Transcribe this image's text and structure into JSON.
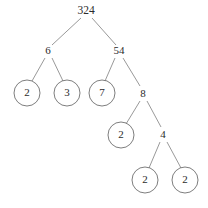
{
  "figure": {
    "width": 208,
    "height": 208,
    "background": "#ffffff",
    "line_color": "#8d8d8d",
    "circle_color": "#6f6f6f",
    "text_color": "#2b2b2b"
  },
  "chart_data": {
    "type": "diagram",
    "diagram_kind": "factor tree",
    "title": "",
    "root_value": 324,
    "nodes": [
      {
        "id": "n324",
        "label": "324",
        "value": 324,
        "x": 86,
        "y": 11,
        "circled": false,
        "depth": 0
      },
      {
        "id": "n6",
        "label": "6",
        "value": 6,
        "x": 48,
        "y": 51,
        "circled": false,
        "depth": 1
      },
      {
        "id": "n54",
        "label": "54",
        "value": 54,
        "x": 119,
        "y": 51,
        "circled": false,
        "depth": 1
      },
      {
        "id": "n2a",
        "label": "2",
        "value": 2,
        "x": 27,
        "y": 93,
        "circled": true,
        "depth": 2
      },
      {
        "id": "n3",
        "label": "3",
        "value": 3,
        "x": 67,
        "y": 93,
        "circled": true,
        "depth": 2
      },
      {
        "id": "n7",
        "label": "7",
        "value": 7,
        "x": 102,
        "y": 93,
        "circled": true,
        "depth": 2
      },
      {
        "id": "n8",
        "label": "8",
        "value": 8,
        "x": 143,
        "y": 94,
        "circled": false,
        "depth": 2
      },
      {
        "id": "n2b",
        "label": "2",
        "value": 2,
        "x": 121,
        "y": 135,
        "circled": true,
        "depth": 3
      },
      {
        "id": "n4",
        "label": "4",
        "value": 4,
        "x": 163,
        "y": 135,
        "circled": false,
        "depth": 3
      },
      {
        "id": "n2c",
        "label": "2",
        "value": 2,
        "x": 145,
        "y": 180,
        "circled": true,
        "depth": 4
      },
      {
        "id": "n2d",
        "label": "2",
        "value": 2,
        "x": 185,
        "y": 180,
        "circled": true,
        "depth": 4
      }
    ],
    "edges": [
      {
        "from": "n324",
        "to": "n6",
        "x1": 81,
        "y1": 18,
        "x2": 52,
        "y2": 45
      },
      {
        "from": "n324",
        "to": "n54",
        "x1": 92,
        "y1": 18,
        "x2": 116,
        "y2": 45
      },
      {
        "from": "n6",
        "to": "n2a",
        "x1": 45,
        "y1": 58,
        "x2": 32,
        "y2": 81
      },
      {
        "from": "n6",
        "to": "n3",
        "x1": 52,
        "y1": 58,
        "x2": 63,
        "y2": 81
      },
      {
        "from": "n54",
        "to": "n7",
        "x1": 115,
        "y1": 58,
        "x2": 105,
        "y2": 81
      },
      {
        "from": "n54",
        "to": "n8",
        "x1": 123,
        "y1": 58,
        "x2": 140,
        "y2": 86
      },
      {
        "from": "n8",
        "to": "n2b",
        "x1": 140,
        "y1": 101,
        "x2": 126,
        "y2": 124
      },
      {
        "from": "n8",
        "to": "n4",
        "x1": 147,
        "y1": 101,
        "x2": 161,
        "y2": 127
      },
      {
        "from": "n4",
        "to": "n2c",
        "x1": 160,
        "y1": 142,
        "x2": 149,
        "y2": 168
      },
      {
        "from": "n4",
        "to": "n2d",
        "x1": 167,
        "y1": 142,
        "x2": 181,
        "y2": 168
      }
    ],
    "circle_radius": 13,
    "prime_leaves": [
      2,
      3,
      7,
      2,
      2,
      2
    ]
  }
}
